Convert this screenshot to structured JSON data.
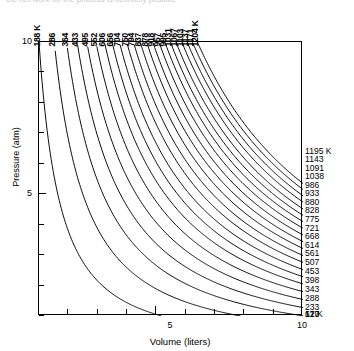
{
  "figure": {
    "clipped_caption": "the net work for the process is definitely positive",
    "annotation": "Adiabats"
  },
  "axes": {
    "x": {
      "title": "Volume (liters)",
      "min": 1,
      "max": 10,
      "labeled_ticks": [
        {
          "value": 5,
          "label": "5"
        },
        {
          "value": 10,
          "label": "10"
        }
      ],
      "tick_values": [
        1,
        2,
        3,
        4,
        5,
        6,
        7,
        8,
        9,
        10
      ]
    },
    "y": {
      "title": "Pressure (atm)",
      "min": 1,
      "max": 10,
      "labeled_ticks": [
        {
          "value": 10,
          "label": "10"
        },
        {
          "value": 5,
          "label": "5"
        }
      ],
      "tick_values": [
        1,
        2,
        3,
        4,
        5,
        6,
        7,
        8,
        9,
        10
      ]
    }
  },
  "chart_data": {
    "type": "line",
    "title": "",
    "xlabel": "Volume (liters)",
    "ylabel": "Pressure (atm)",
    "xlim": [
      1,
      10
    ],
    "ylim": [
      1,
      10
    ],
    "grid": false,
    "legend": "none",
    "annotations": [
      "Adiabats"
    ],
    "top_axis_label_suffix": "K",
    "right_axis_label_suffix": "K",
    "series": [
      {
        "name": "188 K",
        "top_label": "188 K",
        "right_label": "61 K",
        "top_temperature": 188,
        "right_temperature": 61,
        "volume_at_p10": 1.0,
        "pressure_at_v10": 0.32
      },
      {
        "name": "286 K",
        "top_label": "286",
        "right_label": "120",
        "top_temperature": 286,
        "right_temperature": 120,
        "volume_at_p10": 1.52,
        "pressure_at_v10": 0.63
      },
      {
        "name": "364 K",
        "top_label": "364",
        "right_label": "177",
        "top_temperature": 364,
        "right_temperature": 177,
        "volume_at_p10": 1.94,
        "pressure_at_v10": 0.94
      },
      {
        "name": "433 K",
        "top_label": "433",
        "right_label": "233",
        "top_temperature": 433,
        "right_temperature": 233,
        "volume_at_p10": 2.3,
        "pressure_at_v10": 1.24
      },
      {
        "name": "495 K",
        "top_label": "495",
        "right_label": "288",
        "top_temperature": 495,
        "right_temperature": 288,
        "volume_at_p10": 2.63,
        "pressure_at_v10": 1.53
      },
      {
        "name": "552 K",
        "top_label": "552",
        "right_label": "343",
        "top_temperature": 552,
        "right_temperature": 343,
        "volume_at_p10": 2.94,
        "pressure_at_v10": 1.83
      },
      {
        "name": "606 K",
        "top_label": "606",
        "right_label": "398",
        "top_temperature": 606,
        "right_temperature": 398,
        "volume_at_p10": 3.23,
        "pressure_at_v10": 2.12
      },
      {
        "name": "656 K",
        "top_label": "656",
        "right_label": "453",
        "top_temperature": 656,
        "right_temperature": 453,
        "volume_at_p10": 3.49,
        "pressure_at_v10": 2.41
      },
      {
        "name": "704 K",
        "top_label": "704",
        "right_label": "507",
        "top_temperature": 704,
        "right_temperature": 507,
        "volume_at_p10": 3.74,
        "pressure_at_v10": 2.7
      },
      {
        "name": "750 K",
        "top_label": "750",
        "right_label": "561",
        "top_temperature": 750,
        "right_temperature": 561,
        "volume_at_p10": 3.99,
        "pressure_at_v10": 2.99
      },
      {
        "name": "794 K",
        "top_label": "794",
        "right_label": "614",
        "top_temperature": 794,
        "right_temperature": 614,
        "volume_at_p10": 4.22,
        "pressure_at_v10": 3.27
      },
      {
        "name": "837 K",
        "top_label": "837",
        "right_label": "668",
        "top_temperature": 837,
        "right_temperature": 668,
        "volume_at_p10": 4.45,
        "pressure_at_v10": 3.55
      },
      {
        "name": "878 K",
        "top_label": "878",
        "right_label": "721",
        "top_temperature": 878,
        "right_temperature": 721,
        "volume_at_p10": 4.67,
        "pressure_at_v10": 3.84
      },
      {
        "name": "918 K",
        "top_label": "918",
        "right_label": "775",
        "top_temperature": 918,
        "right_temperature": 775,
        "volume_at_p10": 4.88,
        "pressure_at_v10": 4.12
      },
      {
        "name": "957 K",
        "top_label": "957",
        "right_label": "828",
        "top_temperature": 957,
        "right_temperature": 828,
        "volume_at_p10": 5.09,
        "pressure_at_v10": 4.4
      },
      {
        "name": "995 K",
        "top_label": "995",
        "right_label": "880",
        "top_temperature": 995,
        "right_temperature": 880,
        "volume_at_p10": 5.29,
        "pressure_at_v10": 4.68
      },
      {
        "name": "1031 K",
        "top_label": "1031",
        "right_label": "933",
        "top_temperature": 1031,
        "right_temperature": 933,
        "volume_at_p10": 5.48,
        "pressure_at_v10": 4.96
      },
      {
        "name": "1067 K",
        "top_label": "1067",
        "right_label": "986",
        "top_temperature": 1067,
        "right_temperature": 986,
        "volume_at_p10": 5.67,
        "pressure_at_v10": 5.24
      },
      {
        "name": "1103 K",
        "top_label": "1103",
        "right_label": "1038",
        "top_temperature": 1103,
        "right_temperature": 1038,
        "volume_at_p10": 5.87,
        "pressure_at_v10": 5.52
      },
      {
        "name": "1137 K",
        "top_label": "1137",
        "right_label": "1091",
        "top_temperature": 1137,
        "right_temperature": 1091,
        "volume_at_p10": 6.05,
        "pressure_at_v10": 5.8
      },
      {
        "name": "1171 K",
        "top_label": "1171",
        "right_label": "1143",
        "top_temperature": 1171,
        "right_temperature": 1143,
        "volume_at_p10": 6.23,
        "pressure_at_v10": 6.08
      },
      {
        "name": "1204 K",
        "top_label": "1204 K",
        "right_label": "1195 K",
        "top_temperature": 1204,
        "right_temperature": 1195,
        "volume_at_p10": 6.4,
        "pressure_at_v10": 6.36
      }
    ]
  }
}
